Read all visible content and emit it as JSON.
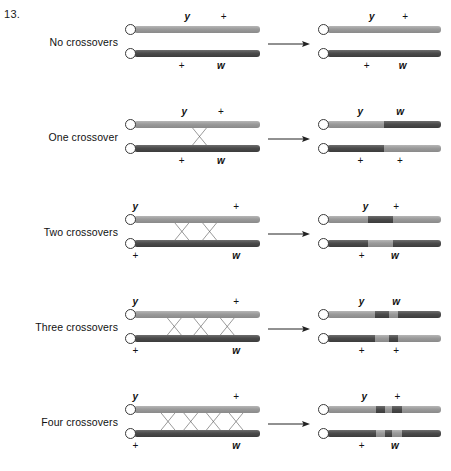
{
  "figure": {
    "number": "13.",
    "rows": [
      {
        "label": "No crossovers",
        "crossovers": 0,
        "crossover_x_positions": [],
        "left": {
          "top_chromatid": {
            "segments": [
              {
                "shade": "light",
                "width": 100
              }
            ]
          },
          "bottom_chromatid": {
            "segments": [
              {
                "shade": "dark",
                "width": 100
              }
            ]
          },
          "labels_above": [
            {
              "text": "y",
              "italic": true,
              "x": 48
            },
            {
              "text": "+",
              "italic": false,
              "x": 74
            }
          ],
          "labels_below": [
            {
              "text": "+",
              "italic": false,
              "x": 44
            },
            {
              "text": "w",
              "italic": true,
              "x": 72
            }
          ]
        },
        "right": {
          "top_chromatid": {
            "segments": [
              {
                "shade": "light",
                "width": 100
              }
            ]
          },
          "bottom_chromatid": {
            "segments": [
              {
                "shade": "dark",
                "width": 100
              }
            ]
          },
          "labels_above": [
            {
              "text": "y",
              "italic": true,
              "x": 46
            },
            {
              "text": "+",
              "italic": false,
              "x": 72
            }
          ],
          "labels_below": [
            {
              "text": "+",
              "italic": false,
              "x": 42
            },
            {
              "text": "w",
              "italic": true,
              "x": 70
            }
          ]
        }
      },
      {
        "label": "One crossover",
        "crossovers": 1,
        "crossover_x_positions": [
          52
        ],
        "left": {
          "top_chromatid": {
            "segments": [
              {
                "shade": "light",
                "width": 100
              }
            ]
          },
          "bottom_chromatid": {
            "segments": [
              {
                "shade": "dark",
                "width": 100
              }
            ]
          },
          "labels_above": [
            {
              "text": "y",
              "italic": true,
              "x": 46
            },
            {
              "text": "+",
              "italic": false,
              "x": 72
            }
          ],
          "labels_below": [
            {
              "text": "+",
              "italic": false,
              "x": 44
            },
            {
              "text": "w",
              "italic": true,
              "x": 72
            }
          ]
        },
        "right": {
          "top_chromatid": {
            "segments": [
              {
                "shade": "light",
                "width": 50
              },
              {
                "shade": "dark",
                "width": 50
              }
            ]
          },
          "bottom_chromatid": {
            "segments": [
              {
                "shade": "dark",
                "width": 50
              },
              {
                "shade": "light",
                "width": 50
              }
            ]
          },
          "labels_above": [
            {
              "text": "y",
              "italic": true,
              "x": 37
            },
            {
              "text": "w",
              "italic": true,
              "x": 68
            }
          ],
          "labels_below": [
            {
              "text": "+",
              "italic": false,
              "x": 37
            },
            {
              "text": "+",
              "italic": false,
              "x": 68
            }
          ]
        }
      },
      {
        "label": "Two crossovers",
        "crossovers": 2,
        "crossover_x_positions": [
          38,
          60
        ],
        "left": {
          "top_chromatid": {
            "segments": [
              {
                "shade": "light",
                "width": 100
              }
            ]
          },
          "bottom_chromatid": {
            "segments": [
              {
                "shade": "dark",
                "width": 100
              }
            ]
          },
          "labels_above": [
            {
              "text": "y",
              "italic": true,
              "x": 11
            },
            {
              "text": "+",
              "italic": false,
              "x": 83
            }
          ],
          "labels_below": [
            {
              "text": "+",
              "italic": false,
              "x": 11
            },
            {
              "text": "w",
              "italic": true,
              "x": 83
            }
          ]
        },
        "right": {
          "top_chromatid": {
            "segments": [
              {
                "shade": "light",
                "width": 36
              },
              {
                "shade": "dark",
                "width": 22
              },
              {
                "shade": "light",
                "width": 42
              }
            ]
          },
          "bottom_chromatid": {
            "segments": [
              {
                "shade": "dark",
                "width": 36
              },
              {
                "shade": "light",
                "width": 22
              },
              {
                "shade": "dark",
                "width": 42
              }
            ]
          },
          "labels_above": [
            {
              "text": "y",
              "italic": true,
              "x": 41
            },
            {
              "text": "+",
              "italic": false,
              "x": 65
            }
          ],
          "labels_below": [
            {
              "text": "+",
              "italic": false,
              "x": 38
            },
            {
              "text": "w",
              "italic": true,
              "x": 64
            }
          ]
        }
      },
      {
        "label": "Three crossovers",
        "crossovers": 3,
        "crossover_x_positions": [
          32,
          53,
          74
        ],
        "left": {
          "top_chromatid": {
            "segments": [
              {
                "shade": "light",
                "width": 100
              }
            ]
          },
          "bottom_chromatid": {
            "segments": [
              {
                "shade": "dark",
                "width": 100
              }
            ]
          },
          "labels_above": [
            {
              "text": "y",
              "italic": true,
              "x": 11
            },
            {
              "text": "+",
              "italic": false,
              "x": 83
            }
          ],
          "labels_below": [
            {
              "text": "+",
              "italic": false,
              "x": 11
            },
            {
              "text": "w",
              "italic": true,
              "x": 83
            }
          ]
        },
        "right": {
          "top_chromatid": {
            "segments": [
              {
                "shade": "light",
                "width": 42
              },
              {
                "shade": "dark",
                "width": 12
              },
              {
                "shade": "light",
                "width": 8
              },
              {
                "shade": "dark",
                "width": 38
              }
            ]
          },
          "bottom_chromatid": {
            "segments": [
              {
                "shade": "dark",
                "width": 42
              },
              {
                "shade": "light",
                "width": 12
              },
              {
                "shade": "dark",
                "width": 8
              },
              {
                "shade": "light",
                "width": 38
              }
            ]
          },
          "labels_above": [
            {
              "text": "y",
              "italic": true,
              "x": 38
            },
            {
              "text": "w",
              "italic": true,
              "x": 65
            }
          ],
          "labels_below": [
            {
              "text": "+",
              "italic": false,
              "x": 38
            },
            {
              "text": "+",
              "italic": false,
              "x": 65
            }
          ]
        }
      },
      {
        "label": "Four crossovers",
        "crossovers": 4,
        "crossover_x_positions": [
          27,
          45,
          63,
          81
        ],
        "left": {
          "top_chromatid": {
            "segments": [
              {
                "shade": "light",
                "width": 100
              }
            ]
          },
          "bottom_chromatid": {
            "segments": [
              {
                "shade": "dark",
                "width": 100
              }
            ]
          },
          "labels_above": [
            {
              "text": "y",
              "italic": true,
              "x": 11
            },
            {
              "text": "+",
              "italic": false,
              "x": 83
            }
          ],
          "labels_below": [
            {
              "text": "+",
              "italic": false,
              "x": 11
            },
            {
              "text": "w",
              "italic": true,
              "x": 83
            }
          ]
        },
        "right": {
          "top_chromatid": {
            "segments": [
              {
                "shade": "light",
                "width": 43
              },
              {
                "shade": "dark",
                "width": 8
              },
              {
                "shade": "light",
                "width": 6
              },
              {
                "shade": "dark",
                "width": 9
              },
              {
                "shade": "light",
                "width": 34
              }
            ]
          },
          "bottom_chromatid": {
            "segments": [
              {
                "shade": "dark",
                "width": 43
              },
              {
                "shade": "light",
                "width": 8
              },
              {
                "shade": "dark",
                "width": 6
              },
              {
                "shade": "light",
                "width": 9
              },
              {
                "shade": "dark",
                "width": 34
              }
            ]
          },
          "labels_above": [
            {
              "text": "y",
              "italic": true,
              "x": 40
            },
            {
              "text": "+",
              "italic": false,
              "x": 66
            }
          ],
          "labels_below": [
            {
              "text": "+",
              "italic": false,
              "x": 38
            },
            {
              "text": "w",
              "italic": true,
              "x": 64
            }
          ]
        }
      }
    ],
    "arrow_icon": "right-arrow-icon",
    "colors": {
      "light_chromatid": "#9a9a9a",
      "dark_chromatid": "#4b4b4b",
      "text": "#111111",
      "background": "#ffffff"
    }
  }
}
